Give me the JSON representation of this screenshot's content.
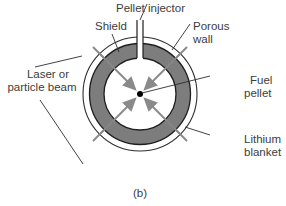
{
  "labels": {
    "pellet_injector": "Pellet injector",
    "shield": "Shield",
    "porous_wall_1": "Porous",
    "porous_wall_2": "wall",
    "laser_1": "Laser or",
    "laser_2": "particle beam",
    "fuel_pellet_1": "Fuel",
    "fuel_pellet_2": "pellet",
    "lithium_blanket_1": "Lithium",
    "lithium_blanket_2": "blanket",
    "caption": "(b)"
  },
  "colors": {
    "blanket": "#7d7d7d",
    "line": "#2e2e2e",
    "arrow": "#8a8a8a",
    "pellet": "#000000"
  }
}
